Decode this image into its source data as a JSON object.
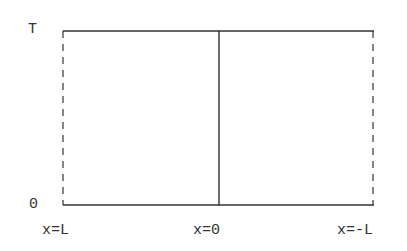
{
  "diagram": {
    "type": "spacetime-domain",
    "y_axis": {
      "top_label": "T",
      "bottom_label": "0"
    },
    "x_axis": {
      "left_label": "x=L",
      "center_label": "x=0",
      "right_label": "x=-L"
    },
    "region": {
      "left_boundary": "dashed",
      "right_boundary": "dashed",
      "top_boundary": "solid",
      "bottom_boundary": "solid",
      "center_divider": "solid"
    },
    "colors": {
      "line": "#333333",
      "background": "#ffffff"
    }
  }
}
